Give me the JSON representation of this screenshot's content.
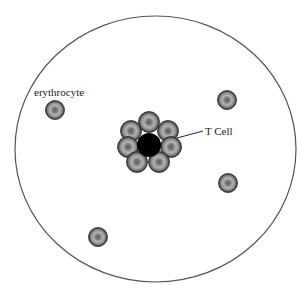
{
  "diagram": {
    "type": "biological-schematic",
    "boundary": {
      "shape": "ellipse",
      "cx": 155.5,
      "cy": 149,
      "rx": 140.5,
      "ry": 133,
      "stroke": "#555555"
    },
    "labels": {
      "erythrocyte": "erythrocyte",
      "t_cell": "T Cell"
    },
    "free_erythrocytes": [
      {
        "cx": 55,
        "cy": 110
      },
      {
        "cx": 227,
        "cy": 100
      },
      {
        "cx": 228,
        "cy": 183
      },
      {
        "cx": 98,
        "cy": 237
      }
    ],
    "t_cell": {
      "cx": 149,
      "cy": 145,
      "r": 12,
      "color": "#000000"
    },
    "rosette_erythrocytes": [
      {
        "cx": 149,
        "cy": 122
      },
      {
        "cx": 131,
        "cy": 131
      },
      {
        "cx": 168,
        "cy": 131
      },
      {
        "cx": 128,
        "cy": 147
      },
      {
        "cx": 171,
        "cy": 147
      },
      {
        "cx": 137,
        "cy": 162
      },
      {
        "cx": 159,
        "cy": 162
      }
    ],
    "leader_line": {
      "x1": 177,
      "y1": 138,
      "x2": 203,
      "y2": 131
    },
    "colors": {
      "erythrocyte_outer": "#3a3a3a",
      "erythrocyte_mid": "#9a9a9a",
      "erythrocyte_center": "#6a6a6a"
    }
  }
}
